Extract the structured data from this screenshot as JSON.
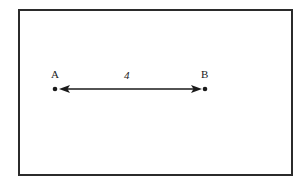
{
  "figure": {
    "type": "line-segment-measure-diagram",
    "frame": {
      "border_color": "#2b2b2b",
      "background_color": "#ffffff"
    },
    "stroke_color": "#1a1a1a",
    "points": [
      {
        "id": "a",
        "label": "A",
        "x": 55,
        "y": 89
      },
      {
        "id": "b",
        "label": "B",
        "x": 205,
        "y": 89
      }
    ],
    "segment": {
      "length_label": "4",
      "arrow_style": "double-headed",
      "from": "A",
      "to": "B",
      "y": 89,
      "x_start": 59,
      "x_end": 202
    }
  }
}
